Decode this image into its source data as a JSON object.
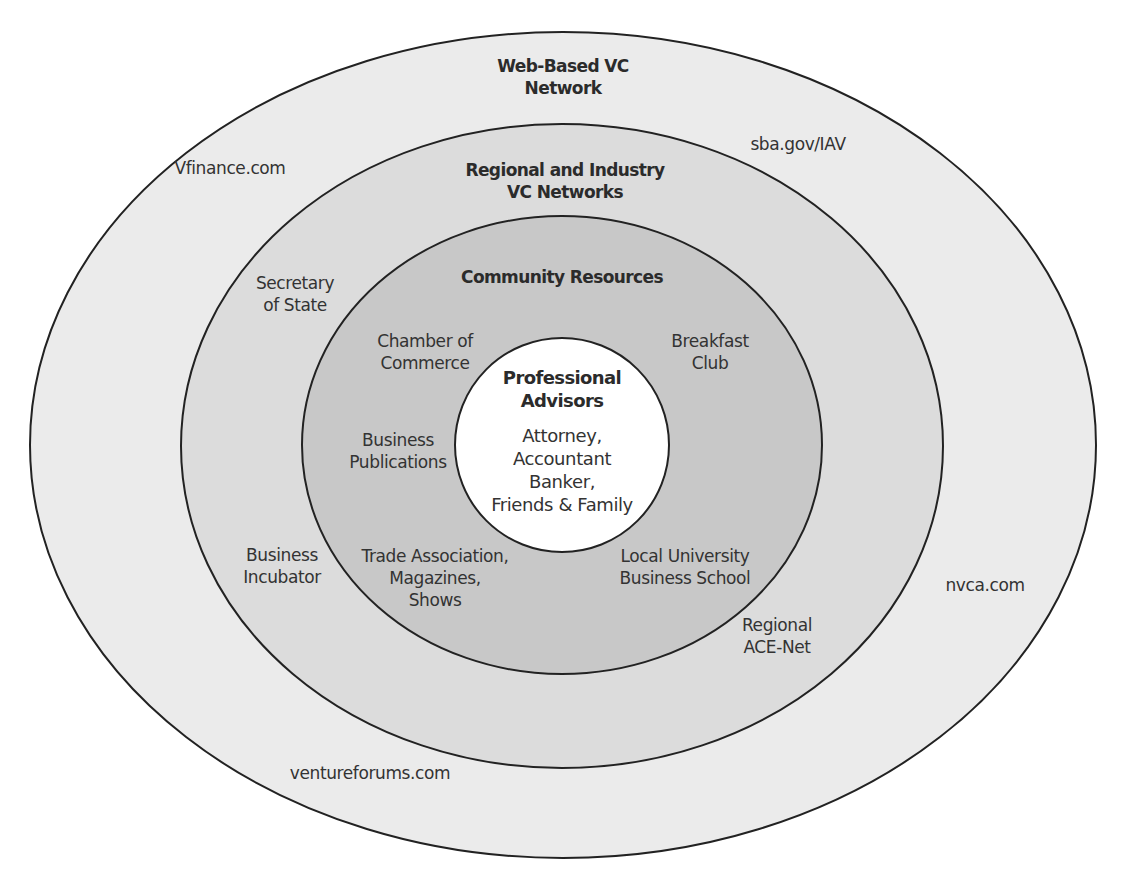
{
  "diagram": {
    "type": "concentric-ellipses",
    "colors": {
      "outer_ring": "#ebebeb",
      "regional_ring": "#dcdcdc",
      "community_ring": "#c8c8c8",
      "core": "#ffffff",
      "stroke": "#222222"
    },
    "rings": [
      {
        "title": [
          "Web-Based VC",
          "Network"
        ],
        "items": [
          {
            "lines": [
              "Vfinance.com"
            ]
          },
          {
            "lines": [
              "sba.gov/IAV"
            ]
          },
          {
            "lines": [
              "nvca.com"
            ]
          },
          {
            "lines": [
              "ventureforums.com"
            ]
          }
        ]
      },
      {
        "title": [
          "Regional and Industry",
          "VC Networks"
        ],
        "items": [
          {
            "lines": [
              "Secretary",
              "of State"
            ]
          },
          {
            "lines": [
              "Business",
              "Incubator"
            ]
          },
          {
            "lines": [
              "Regional",
              "ACE-Net"
            ]
          }
        ]
      },
      {
        "title": [
          "Community Resources"
        ],
        "items": [
          {
            "lines": [
              "Chamber of",
              "Commerce"
            ]
          },
          {
            "lines": [
              "Breakfast",
              "Club"
            ]
          },
          {
            "lines": [
              "Business",
              "Publications"
            ]
          },
          {
            "lines": [
              "Trade Association,",
              "Magazines,",
              "Shows"
            ]
          },
          {
            "lines": [
              "Local University",
              "Business School"
            ]
          }
        ]
      },
      {
        "title": [
          "Professional",
          "Advisors"
        ],
        "items": [
          {
            "lines": [
              "Attorney,",
              "Accountant",
              "Banker,",
              "Friends & Family"
            ]
          }
        ]
      }
    ]
  }
}
